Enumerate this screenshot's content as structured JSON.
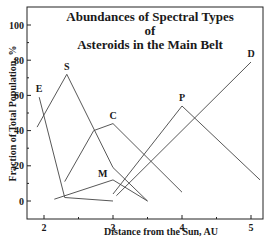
{
  "chart_data": {
    "type": "line",
    "title": "Abundances of Spectral Types of Asteroids in the Main Belt",
    "title_lines": [
      "Abundances of Spectral Types of",
      "Asteroids in the Main Belt"
    ],
    "xlabel": "Distance from the Sun, AU",
    "ylabel": "Fraction of Total Population, %",
    "xlim": [
      1.75,
      5.2
    ],
    "ylim": [
      -10,
      110
    ],
    "xticks": [
      2,
      3,
      4,
      5
    ],
    "yticks": [
      0,
      20,
      40,
      60,
      80,
      100
    ],
    "grid": false,
    "legend": "inline labels",
    "series": [
      {
        "name": "E",
        "points": [
          [
            1.93,
            59
          ],
          [
            2.3,
            2
          ],
          [
            3.0,
            0
          ]
        ],
        "label_at": [
          1.93,
          60
        ]
      },
      {
        "name": "S",
        "points": [
          [
            1.9,
            42
          ],
          [
            2.33,
            72
          ],
          [
            3.0,
            19
          ],
          [
            3.5,
            0
          ]
        ],
        "label_at": [
          2.33,
          73
        ]
      },
      {
        "name": "C",
        "points": [
          [
            2.3,
            11
          ],
          [
            2.72,
            40
          ],
          [
            3.0,
            44
          ],
          [
            4.0,
            5
          ]
        ],
        "label_at": [
          3.0,
          45
        ]
      },
      {
        "name": "M",
        "points": [
          [
            2.15,
            1
          ],
          [
            3.0,
            12
          ],
          [
            3.5,
            0
          ]
        ],
        "label_at": [
          2.85,
          12
        ]
      },
      {
        "name": "P",
        "points": [
          [
            3.0,
            4
          ],
          [
            4.0,
            54
          ],
          [
            5.13,
            12
          ]
        ],
        "label_at": [
          4.0,
          55
        ]
      },
      {
        "name": "D",
        "points": [
          [
            3.05,
            3
          ],
          [
            5.0,
            79
          ]
        ],
        "label_at": [
          5.0,
          80
        ]
      }
    ]
  }
}
